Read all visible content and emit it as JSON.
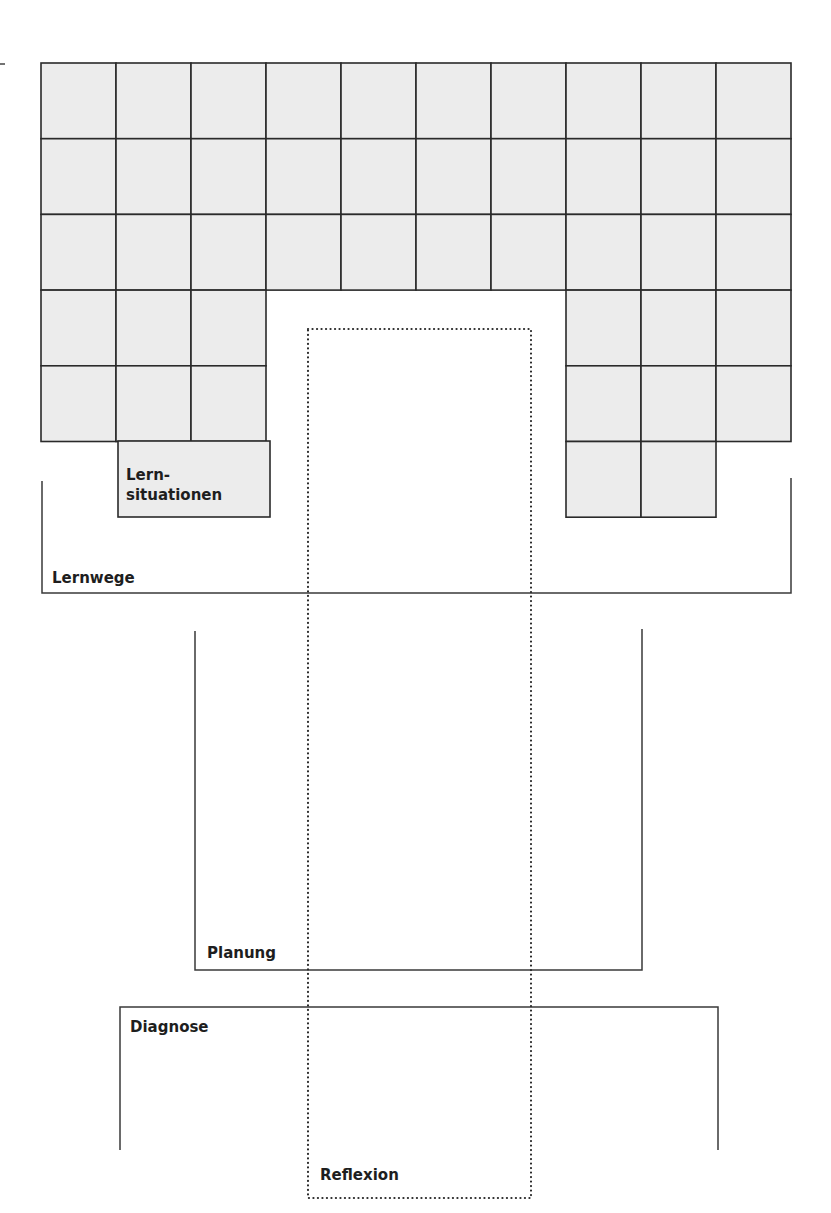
{
  "diagram": {
    "grid": {
      "columns": 10,
      "rows": 6,
      "occupied_cells": {
        "row_1": [
          1,
          2,
          3,
          4,
          5,
          6,
          7,
          8,
          9,
          10
        ],
        "row_2": [
          1,
          2,
          3,
          4,
          5,
          6,
          7,
          8,
          9,
          10
        ],
        "row_3": [
          1,
          2,
          3,
          4,
          5,
          6,
          7,
          8,
          9,
          10
        ],
        "row_4": [
          1,
          2,
          3,
          8,
          9,
          10
        ],
        "row_5": [
          1,
          2,
          3,
          8,
          9,
          10
        ],
        "row_6": [
          8,
          9
        ]
      },
      "merged_cell": {
        "row": 6,
        "columns": [
          2,
          3
        ],
        "label_line1": "Lern-",
        "label_line2": "situationen"
      },
      "cell_fill": "#ececec",
      "line_color": "#2a2a2a"
    },
    "labels": {
      "lernsituationen_line1": "Lern-",
      "lernsituationen_line2": "situationen",
      "lernwege": "Lernwege",
      "planung": "Planung",
      "diagnose": "Diagnose",
      "reflexion": "Reflexion"
    },
    "brackets": [
      {
        "name": "Lernwege",
        "style": "open-top"
      },
      {
        "name": "Planung",
        "style": "open-top"
      },
      {
        "name": "Diagnose",
        "style": "open-bottom"
      },
      {
        "name": "Reflexion",
        "style": "dotted-rectangle"
      }
    ]
  }
}
